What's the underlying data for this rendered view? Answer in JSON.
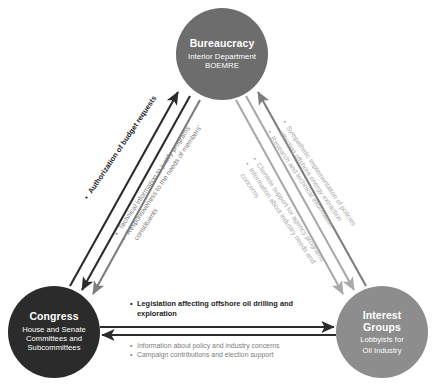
{
  "diagram": {
    "type": "iron-triangle",
    "title": "",
    "colors": {
      "bureaucracy": "#6d6d6d",
      "congress": "#2b2b2b",
      "interest_groups": "#8d8d8d",
      "arrow_dark": "#2b2b2b",
      "arrow_mid": "#7d7d7d",
      "arrow_light": "#a9a9a9",
      "background": "#ffffff",
      "node_text": "#ffffff"
    },
    "nodes": {
      "bureaucracy": {
        "title": "Bureaucracy",
        "sub_line_1": "Interior Department",
        "sub_line_2": "BOEMRE"
      },
      "congress": {
        "title": "Congress",
        "sub_line_1": "House and Senate",
        "sub_line_2": "Committees and",
        "sub_line_3": "Subcommittees"
      },
      "interest_groups": {
        "title_line_1": "Interest",
        "title_line_2": "Groups",
        "sub_line_1": "Lobbyists for",
        "sub_line_2": "Oil Industry"
      }
    },
    "annotations": {
      "congress_to_bureaucracy": {
        "label": "Authorization of budget requests"
      },
      "bureaucracy_to_congress": {
        "item_1": "Technical information to justify programs",
        "item_2": "Responsiveness to the needs of members'",
        "item_3": "constituents"
      },
      "bureaucracy_to_interest": {
        "item_1": "Sympathetic implementation of policies",
        "item_2": "affecting offshore energy extraction",
        "item_3": "Research and technical information"
      },
      "interest_to_bureaucracy": {
        "item_1": "Clientele support for agency programs",
        "item_2": "Information about industry needs and",
        "item_3": "concerns"
      },
      "congress_to_interest": {
        "item_1_line_1": "Legislation affecting offshore oil  drilling and",
        "item_1_line_2": "exploration"
      },
      "interest_to_congress": {
        "item_1": "Information about policy and industry concerns",
        "item_2": "Campaign contributions and election support"
      }
    }
  }
}
